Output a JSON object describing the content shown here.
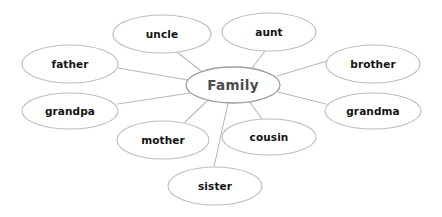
{
  "diagram": {
    "type": "mind-map",
    "title": "Family",
    "background_color": "#ffffff",
    "node_stroke_color": "#bdbdbd",
    "edge_stroke_color": "#b9b9b9",
    "central_text_color": "#4c4c4c",
    "branch_text_color": "#131313",
    "central": {
      "label": "Family",
      "cx": 233,
      "cy": 85,
      "rx": 47,
      "ry": 18
    },
    "branches": [
      {
        "label": "uncle",
        "cx": 162,
        "cy": 34,
        "rx": 49,
        "ry": 19
      },
      {
        "label": "aunt",
        "cx": 269,
        "cy": 32,
        "rx": 47,
        "ry": 19
      },
      {
        "label": "father",
        "cx": 70,
        "cy": 64,
        "rx": 48,
        "ry": 19
      },
      {
        "label": "brother",
        "cx": 373,
        "cy": 64,
        "rx": 47,
        "ry": 19
      },
      {
        "label": "grandpa",
        "cx": 70,
        "cy": 111,
        "rx": 48,
        "ry": 18
      },
      {
        "label": "grandma",
        "cx": 373,
        "cy": 111,
        "rx": 48,
        "ry": 18
      },
      {
        "label": "mother",
        "cx": 163,
        "cy": 140,
        "rx": 46,
        "ry": 19
      },
      {
        "label": "cousin",
        "cx": 269,
        "cy": 137,
        "rx": 47,
        "ry": 18
      },
      {
        "label": "sister",
        "cx": 215,
        "cy": 186,
        "rx": 47,
        "ry": 19
      }
    ],
    "edges": [
      {
        "from": "Family",
        "to": "uncle",
        "x1": 201,
        "y1": 71,
        "x2": 177,
        "y2": 52
      },
      {
        "from": "Family",
        "to": "aunt",
        "x1": 252,
        "y1": 68,
        "x2": 265,
        "y2": 51
      },
      {
        "from": "Family",
        "to": "father",
        "x1": 188,
        "y1": 80,
        "x2": 118,
        "y2": 68
      },
      {
        "from": "Family",
        "to": "brother",
        "x1": 277,
        "y1": 76,
        "x2": 327,
        "y2": 61
      },
      {
        "from": "Family",
        "to": "grandpa",
        "x1": 190,
        "y1": 93,
        "x2": 118,
        "y2": 104
      },
      {
        "from": "Family",
        "to": "grandma",
        "x1": 278,
        "y1": 92,
        "x2": 326,
        "y2": 104
      },
      {
        "from": "Family",
        "to": "mother",
        "x1": 207,
        "y1": 101,
        "x2": 185,
        "y2": 122
      },
      {
        "from": "Family",
        "to": "cousin",
        "x1": 249,
        "y1": 101,
        "x2": 262,
        "y2": 119
      },
      {
        "from": "Family",
        "to": "sister",
        "x1": 228,
        "y1": 103,
        "x2": 214,
        "y2": 167
      }
    ]
  }
}
